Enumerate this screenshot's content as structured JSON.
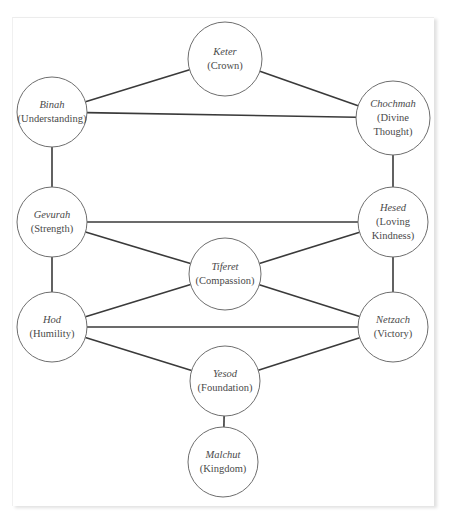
{
  "diagram": {
    "title": "",
    "nodes": [
      {
        "id": "keter",
        "name": "Keter",
        "meaning": "(Crown)",
        "meaning_lines": [
          "(Crown)"
        ],
        "cx": 225,
        "cy": 59,
        "r": 37
      },
      {
        "id": "binah",
        "name": "Binah",
        "meaning": "(Understanding)",
        "meaning_lines": [
          "(Understanding)"
        ],
        "cx": 52,
        "cy": 112,
        "r": 35
      },
      {
        "id": "chochmah",
        "name": "Chochmah",
        "meaning": "(Divine Thought)",
        "meaning_lines": [
          "(Divine",
          "Thought)"
        ],
        "cx": 393,
        "cy": 118,
        "r": 37
      },
      {
        "id": "gevurah",
        "name": "Gevurah",
        "meaning": "(Strength)",
        "meaning_lines": [
          "(Strength)"
        ],
        "cx": 52,
        "cy": 222,
        "r": 35
      },
      {
        "id": "hesed",
        "name": "Hesed",
        "meaning": "(Loving Kindness)",
        "meaning_lines": [
          "(Loving",
          "Kindness)"
        ],
        "cx": 393,
        "cy": 222,
        "r": 35
      },
      {
        "id": "tiferet",
        "name": "Tiferet",
        "meaning": "(Compassion)",
        "meaning_lines": [
          "(Compassion)"
        ],
        "cx": 225,
        "cy": 274,
        "r": 36
      },
      {
        "id": "hod",
        "name": "Hod",
        "meaning": "(Humility)",
        "meaning_lines": [
          "(Humility)"
        ],
        "cx": 52,
        "cy": 327,
        "r": 35
      },
      {
        "id": "netzach",
        "name": "Netzach",
        "meaning": "(Victory)",
        "meaning_lines": [
          "(Victory)"
        ],
        "cx": 393,
        "cy": 327,
        "r": 35
      },
      {
        "id": "yesod",
        "name": "Yesod",
        "meaning": "(Foundation)",
        "meaning_lines": [
          "(Foundation)"
        ],
        "cx": 225,
        "cy": 381,
        "r": 35
      },
      {
        "id": "malchut",
        "name": "Malchut",
        "meaning": "(Kingdom)",
        "meaning_lines": [
          "(Kingdom)"
        ],
        "cx": 223,
        "cy": 462,
        "r": 35
      }
    ],
    "edges": [
      {
        "from": "binah",
        "to": "keter"
      },
      {
        "from": "keter",
        "to": "chochmah"
      },
      {
        "from": "binah",
        "to": "chochmah"
      },
      {
        "from": "binah",
        "to": "gevurah"
      },
      {
        "from": "chochmah",
        "to": "hesed"
      },
      {
        "from": "gevurah",
        "to": "hesed"
      },
      {
        "from": "gevurah",
        "to": "tiferet"
      },
      {
        "from": "hesed",
        "to": "tiferet"
      },
      {
        "from": "gevurah",
        "to": "hod"
      },
      {
        "from": "hesed",
        "to": "netzach"
      },
      {
        "from": "hod",
        "to": "tiferet"
      },
      {
        "from": "netzach",
        "to": "tiferet"
      },
      {
        "from": "hod",
        "to": "netzach"
      },
      {
        "from": "hod",
        "to": "yesod"
      },
      {
        "from": "netzach",
        "to": "yesod"
      },
      {
        "from": "yesod",
        "to": "malchut"
      }
    ],
    "colors": {
      "edge": "#3a3a3a",
      "node_outline": "#6e6e6e",
      "text": "#4a4a4a",
      "background": "#ffffff"
    }
  }
}
